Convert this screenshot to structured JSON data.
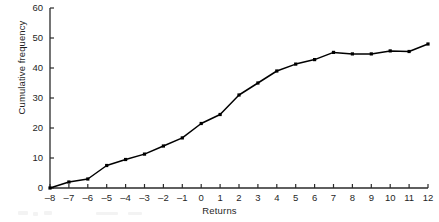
{
  "chart_data": {
    "type": "line",
    "title": "",
    "subtitle": "",
    "xlabel": "Returns",
    "ylabel": "Cumulative frequency",
    "xlim": [
      -8,
      12
    ],
    "ylim": [
      0,
      60
    ],
    "xticks": [
      -8,
      -7,
      -6,
      -5,
      -4,
      -3,
      -2,
      -1,
      0,
      1,
      2,
      3,
      4,
      5,
      6,
      7,
      8,
      9,
      10,
      11,
      12
    ],
    "xtick_labels": [
      "–8",
      "–7",
      "–6",
      "–5",
      "–4",
      "–3",
      "–2",
      "–1",
      "0",
      "1",
      "2",
      "3",
      "4",
      "5",
      "6",
      "7",
      "8",
      "9",
      "10",
      "11",
      "12"
    ],
    "yticks": [
      0,
      10,
      20,
      30,
      40,
      50,
      60
    ],
    "ytick_labels": [
      "0",
      "10",
      "20",
      "30",
      "40",
      "50",
      "60"
    ],
    "grid": false,
    "legend": null,
    "marker": "square",
    "line_color": "#000000",
    "x": [
      -8,
      -7,
      -6,
      -5,
      -4,
      -3,
      -2,
      -1,
      0,
      1,
      2,
      3,
      4,
      5,
      6,
      7,
      8,
      9,
      10,
      11,
      12
    ],
    "values": [
      0,
      2,
      3,
      7.5,
      9.5,
      11.3,
      14,
      16.7,
      21.5,
      24.5,
      31,
      35,
      39,
      41.3,
      42.8,
      45.2,
      44.7,
      44.7,
      45.7,
      45.5,
      48
    ],
    "series": [
      {
        "name": "Cumulative frequency",
        "values": [
          0,
          2,
          3,
          7.5,
          9.5,
          11.3,
          14,
          16.7,
          21.5,
          24.5,
          31,
          35,
          39,
          41.3,
          42.8,
          45.2,
          44.7,
          44.7,
          45.7,
          45.5,
          48
        ]
      }
    ]
  },
  "axes": {
    "x_axis_name": "x-axis",
    "y_axis_name": "y-axis"
  }
}
